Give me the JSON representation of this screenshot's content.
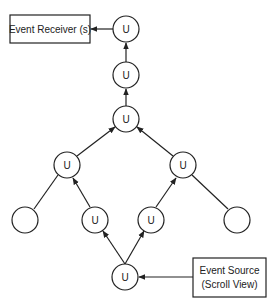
{
  "diagram": {
    "title": "",
    "receiver_box": {
      "label": "Event Receiver (s)"
    },
    "source_box": {
      "line1": "Event Source",
      "line2": "(Scroll View)"
    },
    "nodes": [
      {
        "id": "n1",
        "label": "U",
        "cx": 126,
        "cy": 29
      },
      {
        "id": "n2",
        "label": "U",
        "cx": 126,
        "cy": 75
      },
      {
        "id": "n3",
        "label": "U",
        "cx": 126,
        "cy": 119
      },
      {
        "id": "n4",
        "label": "U",
        "cx": 67,
        "cy": 165
      },
      {
        "id": "n5",
        "label": "U",
        "cx": 183,
        "cy": 165
      },
      {
        "id": "n6",
        "label": "",
        "cx": 25,
        "cy": 220
      },
      {
        "id": "n7",
        "label": "U",
        "cx": 95,
        "cy": 220
      },
      {
        "id": "n8",
        "label": "U",
        "cx": 151,
        "cy": 220
      },
      {
        "id": "n9",
        "label": "",
        "cx": 237,
        "cy": 220
      },
      {
        "id": "n10",
        "label": "U",
        "cx": 125,
        "cy": 277
      }
    ],
    "edges": [
      {
        "from": "source",
        "to": "n10",
        "arrow": true
      },
      {
        "from": "n10",
        "to": "n7",
        "arrow": true
      },
      {
        "from": "n10",
        "to": "n8",
        "arrow": true
      },
      {
        "from": "n7",
        "to": "n4",
        "arrow": true
      },
      {
        "from": "n8",
        "to": "n5",
        "arrow": true
      },
      {
        "from": "n6",
        "to": "n4",
        "arrow": false
      },
      {
        "from": "n9",
        "to": "n5",
        "arrow": false
      },
      {
        "from": "n4",
        "to": "n3",
        "arrow": true
      },
      {
        "from": "n5",
        "to": "n3",
        "arrow": true
      },
      {
        "from": "n3",
        "to": "n2",
        "arrow": true
      },
      {
        "from": "n2",
        "to": "n1",
        "arrow": true
      },
      {
        "from": "n1",
        "to": "receiver",
        "arrow": true
      }
    ],
    "colors": {
      "stroke": "#222222",
      "fill": "#ffffff",
      "text": "#222222"
    }
  }
}
